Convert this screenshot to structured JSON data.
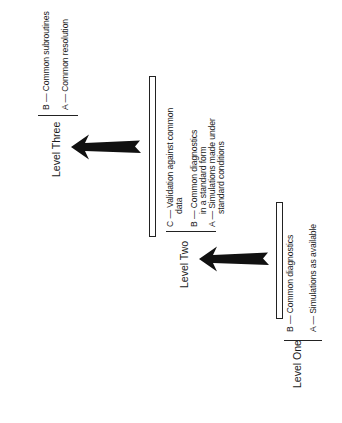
{
  "diagram": {
    "orientation": "rotated-90-ccw",
    "levels": [
      {
        "label": "Level One",
        "items": [
          {
            "key": "A",
            "text": "A — Simulations as available",
            "lines": [
              "A — Simulations as available"
            ]
          },
          {
            "key": "B",
            "text": "B — Common diagnostics",
            "lines": [
              "B — Common diagnostics"
            ]
          }
        ]
      },
      {
        "label": "Level Two",
        "items": [
          {
            "key": "A",
            "text": "A — Simulations made under standard conditions",
            "lines": [
              "A — Simulations made under",
              "standard conditions"
            ]
          },
          {
            "key": "B",
            "text": "B — Common diagnostics in a standard form",
            "lines": [
              "B — Common diagnostics",
              "in a standard form"
            ]
          },
          {
            "key": "C",
            "text": "C — Validation against common data",
            "lines": [
              "C — Validation against common",
              "data"
            ]
          }
        ]
      },
      {
        "label": "Level Three",
        "items": [
          {
            "key": "A",
            "text": "A — Common resolution",
            "lines": [
              "A — Common resolution"
            ]
          },
          {
            "key": "B",
            "text": "B — Common subroutines",
            "lines": [
              "B — Common subroutines"
            ]
          }
        ]
      }
    ],
    "arrows": [
      {
        "from": "Level One",
        "to": "Level Two",
        "icon": "arrow-left-icon"
      },
      {
        "from": "Level Two",
        "to": "Level Three",
        "icon": "arrow-left-icon"
      }
    ],
    "colors": {
      "ink": "#1a1a1a",
      "background": "#ffffff"
    }
  }
}
